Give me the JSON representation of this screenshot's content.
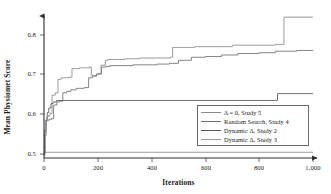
{
  "chart_data": {
    "type": "line",
    "title": "",
    "xlabel": "Iterations",
    "ylabel": "Mean Physiomet Score",
    "xlim": [
      0,
      1000
    ],
    "ylim": [
      0.5,
      0.875
    ],
    "xticks": [
      0,
      200,
      400,
      600,
      800,
      1000
    ],
    "xtick_labels": [
      "0",
      "200",
      "400",
      "600",
      "800",
      "1,000"
    ],
    "yticks": [
      0.5,
      0.6,
      0.7,
      0.8
    ],
    "ytick_labels": [
      "0.5",
      "0.6",
      "0.7",
      "0.8"
    ],
    "grid": false,
    "legend_position": "lower right",
    "step_style": "post",
    "series": [
      {
        "name": "Δ = 0, Study 5",
        "color": "#8a8a8a",
        "x": [
          0,
          3,
          6,
          10,
          16,
          22,
          30,
          42,
          52,
          64,
          96,
          104,
          132,
          168,
          176,
          196,
          212,
          228,
          236,
          300,
          356,
          470,
          478,
          560,
          700,
          860,
          884,
          892,
          1000
        ],
        "values": [
          0.515,
          0.575,
          0.6,
          0.608,
          0.612,
          0.618,
          0.666,
          0.672,
          0.708,
          0.712,
          0.714,
          0.736,
          0.738,
          0.74,
          0.718,
          0.722,
          0.745,
          0.758,
          0.76,
          0.762,
          0.764,
          0.766,
          0.792,
          0.794,
          0.798,
          0.8,
          0.8,
          0.872,
          0.872
        ]
      },
      {
        "name": "Random Search, Study 4",
        "color": "#6f6f6f",
        "x": [
          0,
          4,
          8,
          14,
          20,
          28,
          36,
          48,
          58,
          70,
          84,
          100,
          120,
          150,
          166,
          180,
          196,
          214,
          230,
          246,
          330,
          420,
          466,
          500,
          548,
          600,
          660,
          720,
          800,
          860,
          940,
          1000
        ],
        "values": [
          0.512,
          0.56,
          0.598,
          0.6,
          0.602,
          0.604,
          0.64,
          0.648,
          0.65,
          0.672,
          0.676,
          0.68,
          0.684,
          0.686,
          0.712,
          0.716,
          0.722,
          0.74,
          0.742,
          0.744,
          0.746,
          0.748,
          0.75,
          0.758,
          0.766,
          0.768,
          0.772,
          0.776,
          0.778,
          0.782,
          0.784,
          0.785
        ]
      },
      {
        "name": "Dynamic Δ, Study 2",
        "color": "#555555",
        "x": [
          0,
          3,
          7,
          12,
          18,
          26,
          34,
          46,
          860,
          868,
          1000
        ],
        "values": [
          0.508,
          0.57,
          0.6,
          0.62,
          0.632,
          0.644,
          0.648,
          0.652,
          0.652,
          0.67,
          0.67
        ]
      },
      {
        "name": "Dynamic Δ, Study 3",
        "color": "#9a9a9a",
        "x": [
          0,
          1000
        ],
        "values": [
          0.515,
          0.515
        ]
      }
    ]
  },
  "axes": {
    "ylabel": "Mean Physiomet Score",
    "xlabel": "Iterations",
    "ytick_labels": [
      "0.8",
      "0.7",
      "0.6",
      "0.5"
    ],
    "xtick_labels": [
      "0",
      "200",
      "400",
      "600",
      "800",
      "1,000"
    ]
  },
  "legend": {
    "entries": [
      {
        "label": "Δ = 0, Study 5"
      },
      {
        "label": "Random Search, Study 4"
      },
      {
        "label": "Dynamic Δ, Study 2"
      },
      {
        "label": "Dynamic Δ, Study 3"
      }
    ]
  },
  "colors": {
    "axis": "#2b2b2b",
    "series_1": "#8a8a8a",
    "series_2": "#6f6f6f",
    "series_3": "#555555",
    "series_4": "#9a9a9a",
    "legend_border": "#6a6a6a",
    "background": "#ffffff"
  }
}
